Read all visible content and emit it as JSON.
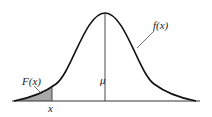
{
  "labels": {
    "pdf": "f(x)",
    "cdf": "F(x)",
    "mean": "μ",
    "x": "x"
  },
  "colors": {
    "curve": "#111111",
    "shade": "#a8a8a8",
    "axis": "#333333"
  }
}
